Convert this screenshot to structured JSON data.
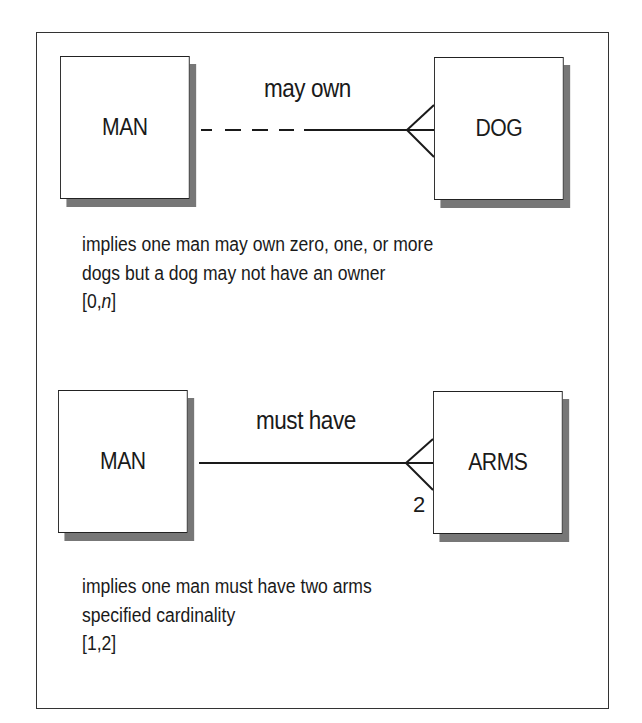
{
  "diagram": {
    "type": "entity-relationship cardinality examples",
    "examples": [
      {
        "left_entity": "MAN",
        "right_entity": "DOG",
        "relationship_label": "may own",
        "line_style": "dashed-then-solid (optional)",
        "right_end": "crow's foot (many)",
        "cardinality_marker": "",
        "description_lines": [
          "implies one man may own zero, one, or more",
          "dogs but a dog may not have an owner"
        ],
        "cardinality_prefix": "[0,",
        "cardinality_var": "n",
        "cardinality_suffix": "]"
      },
      {
        "left_entity": "MAN",
        "right_entity": "ARMS",
        "relationship_label": "must have",
        "line_style": "solid (mandatory)",
        "right_end": "crow's foot (many)",
        "cardinality_marker": "2",
        "description_lines": [
          "implies one man must have two arms",
          "specified cardinality"
        ],
        "cardinality": "[1,2]"
      }
    ]
  },
  "colors": {
    "line": "#1a1a1a",
    "shadow": "#777777",
    "background": "#ffffff"
  }
}
